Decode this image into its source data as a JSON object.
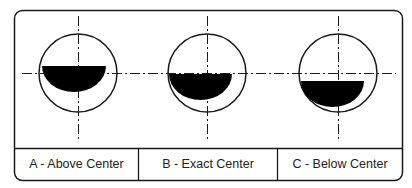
{
  "diagram": {
    "panels": [
      {
        "id": "A",
        "label": "A - Above Center",
        "cx": 78,
        "cy": 73,
        "r": 39,
        "half_cx": 74,
        "half_cy": 66,
        "half_r": 32
      },
      {
        "id": "B",
        "label": "B - Exact Center",
        "cx": 207,
        "cy": 73,
        "r": 39,
        "half_cx": 199,
        "half_cy": 74,
        "half_r": 32
      },
      {
        "id": "C",
        "label": "C - Below Center",
        "cx": 338,
        "cy": 73,
        "r": 39,
        "half_cx": 334,
        "half_cy": 81,
        "half_r": 32
      }
    ],
    "colors": {
      "stroke": "#1a1a1a",
      "fill": "#000000",
      "background": "#ffffff"
    }
  }
}
